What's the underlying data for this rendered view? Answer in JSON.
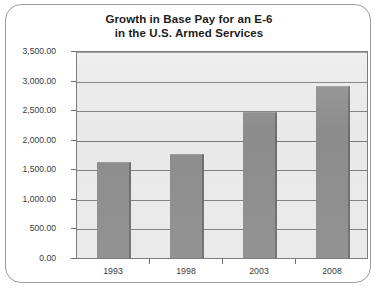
{
  "chart_data": {
    "type": "bar",
    "title": "Growth in Base Pay for an E-6 in the U.S. Armed Services",
    "title_lines": [
      "Growth in Base Pay for an E-6",
      "in the U.S. Armed Services"
    ],
    "categories": [
      "1993",
      "1998",
      "2003",
      "2008"
    ],
    "values": [
      1620,
      1760,
      2470,
      2900
    ],
    "xlabel": "",
    "ylabel": "",
    "ylim": [
      0,
      3500
    ],
    "ytick_values": [
      3500,
      3000,
      2500,
      2000,
      1500,
      1000,
      500,
      0
    ],
    "ytick_labels": [
      "3,500.00",
      "3,000.00",
      "2,500.00",
      "2,000.00",
      "1,500.00",
      "1,000.00",
      "500.00",
      "0.00"
    ],
    "grid": true,
    "legend": null,
    "legend_position": "none",
    "series": [
      {
        "name": "Base Pay",
        "values": [
          1620,
          1760,
          2470,
          2900
        ]
      }
    ],
    "colors": {
      "bar_fill": "#8c8c8c",
      "bar_edge": "#6d6d6d",
      "plot_background": "#e9e9e9",
      "gridline": "#7d7d7d",
      "plot_border": "#7d7d7d",
      "frame_border": "#9a9a9a",
      "page_background": "#ffffff",
      "title_text": "#1c1c1c",
      "tick_text": "#3a3a3a"
    }
  }
}
